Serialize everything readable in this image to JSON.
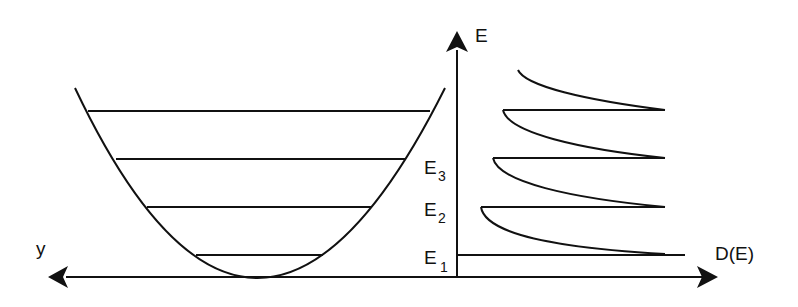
{
  "diagram": {
    "type": "quantum well energy levels and density of states",
    "stroke_color": "#111111",
    "background": "#ffffff",
    "labels": {
      "energy_axis": "E",
      "position_axis": "y",
      "dos_axis": "D(E)",
      "levels": [
        {
          "base": "E",
          "sub": "1"
        },
        {
          "base": "E",
          "sub": "2"
        },
        {
          "base": "E",
          "sub": "3"
        }
      ]
    },
    "potential": {
      "shape": "parabola",
      "energy_levels_count": 4
    },
    "density_of_states": {
      "shape": "step-like sawtooth with 1/sqrt(E) tails",
      "branches": 5
    }
  }
}
